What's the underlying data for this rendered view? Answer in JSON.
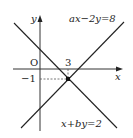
{
  "diagram": {
    "type": "coordinate-graph",
    "axes": {
      "x_label": "x",
      "y_label": "y",
      "origin_label": "O"
    },
    "ticks": {
      "x_tick": "3",
      "y_tick": "−1"
    },
    "lines": [
      {
        "equation": "ax−2y=8",
        "direction": "ascending"
      },
      {
        "equation": "x+by=2",
        "direction": "descending"
      }
    ],
    "intersection": {
      "x": 3,
      "y": -1
    },
    "colors": {
      "stroke": "#222222",
      "dashed": "#555555",
      "point": "#111111"
    }
  }
}
